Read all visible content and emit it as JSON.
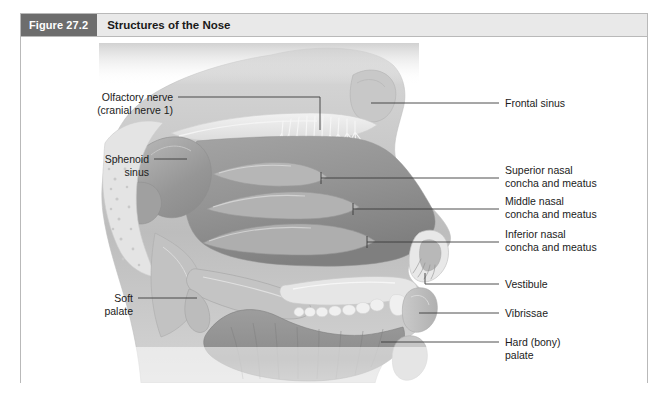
{
  "figure": {
    "number_label": "Figure 27.2",
    "title": "Structures of the Nose",
    "badge_color": "#6d6d6d",
    "header_bg_color": "#e9e9e9",
    "frame_border_color": "#b9b9b9",
    "canvas_bg_color": "#ffffff"
  },
  "illustration": {
    "type": "sagittal-section-anatomical-drawing",
    "subject": "human head midsagittal section showing nasal structures",
    "style": "grayscale shaded medical illustration"
  },
  "labels_left": [
    {
      "id": "olfactory-nerve",
      "line1": "Olfactory nerve",
      "line2": "(cranial nerve 1)"
    },
    {
      "id": "sphenoid-sinus",
      "line1": "Sphenoid",
      "line2": "sinus"
    },
    {
      "id": "soft-palate",
      "line1": "Soft",
      "line2": "palate"
    }
  ],
  "labels_right": [
    {
      "id": "frontal-sinus",
      "line1": "Frontal sinus",
      "line2": ""
    },
    {
      "id": "superior-nasal-concha",
      "line1": "Superior nasal",
      "line2": "concha and meatus"
    },
    {
      "id": "middle-nasal-concha",
      "line1": "Middle nasal",
      "line2": "concha and meatus"
    },
    {
      "id": "inferior-nasal-concha",
      "line1": "Inferior nasal",
      "line2": "concha and meatus"
    },
    {
      "id": "vestibule",
      "line1": "Vestibule",
      "line2": ""
    },
    {
      "id": "vibrissae",
      "line1": "Vibrissae",
      "line2": ""
    },
    {
      "id": "hard-bony-palate",
      "line1": "Hard (bony)",
      "line2": "palate"
    }
  ],
  "colors": {
    "leader_line": "#3a3a3a",
    "label_text": "#1b1b1b",
    "tissue_mid": "#a8a8a8",
    "tissue_dark": "#8a8a8a",
    "bone_light": "#e2e2e2",
    "cavity_shadow": "#9a9a9a"
  }
}
